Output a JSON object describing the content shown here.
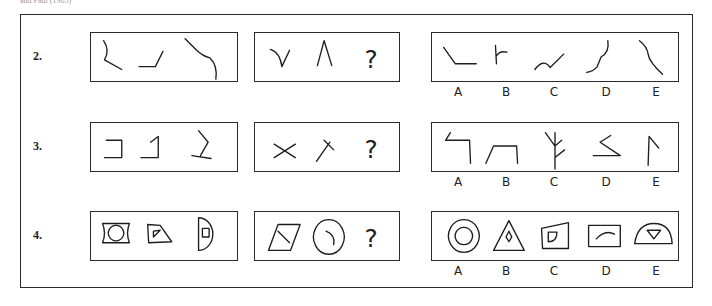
{
  "caption": "and Paul (1985)",
  "rows": [
    {
      "number": "2.",
      "top": 32,
      "example": [
        "M11 8 Q18 18 12 28 L30 38",
        "M48 35 L65 35 L73 19",
        "M96 6 L108 18 Q114 24 122 26 Q130 34 128 48"
      ],
      "question": [
        "M14 17 Q24 20 26 35 L34 18",
        "M63 34 L70 8 L78 34"
      ],
      "question_mark": "?",
      "options": [
        {
          "label": "A",
          "path": "M8 15 L20 32 L42 32"
        },
        {
          "label": "B",
          "path": "M62 13 L63 32 M63 24 Q66 18 74 20"
        },
        {
          "label": "C",
          "path": "M103 38 Q112 26 119 36 L133 22"
        },
        {
          "label": "D",
          "path": "M179 8 Q181 20 172 25 Q170 30 168 35 Q164 40 157 41"
        },
        {
          "label": "E",
          "path": "M212 8 Q220 14 221 22 Q222 30 236 43"
        }
      ]
    },
    {
      "number": "3.",
      "top": 122,
      "example": [
        "M14 18 L30 18 L30 36 L12 36",
        "M60 20 L68 14 L68 36 L50 36",
        "M110 8 L120 20 L112 34 M103 34 L123 37"
      ],
      "question": [
        "M18 22 L40 36 M18 36 L40 22",
        "M62 40 L76 20 M70 18 L80 28"
      ],
      "question_mark": "?",
      "options": [
        {
          "label": "A",
          "path": "M15 10 L10 18 L35 18 L36 42"
        },
        {
          "label": "B",
          "path": "M52 42 L60 24 L84 24 L85 42"
        },
        {
          "label": "C",
          "path": "M114 10 L124 24 L131 18 M124 10 L124 48 M124 36 L134 28"
        },
        {
          "label": "D",
          "path": "M171 20 L182 13 M171 20 L192 34 L164 34"
        },
        {
          "label": "E",
          "path": "M221 44 L222 14 L232 26"
        }
      ]
    },
    {
      "number": "4.",
      "top": 211,
      "example": [
        "M10 12 L38 12 Q34 22 38 32 L10 32 Q14 22 10 12 M24 14 A8 8 0 1 0 24.1 14",
        "M57 13 L70 14 L82 31 L58 32 Z M63 26 L70 19 L63 20 Z",
        "M110 6 A14 16 0 0 1 110 40 Z M114 17 L121 17 L121 26 L114 26 Z"
      ],
      "question": [
        "M12 40 L22 13 L45 13 L35 40 Z M22 20 L34 32",
        "M75 8 A16 18 0 1 1 74.9 8 M72 20 Q82 24 80 34"
      ],
      "question_mark": "?",
      "options": [
        {
          "label": "A",
          "path": "M29 8 A16 17 0 1 0 29.1 8 M29 16 A9 9 0 1 0 29.1 16"
        },
        {
          "label": "B",
          "path": "M76 9 L60 40 L92 40 Z M76 20 L79 26 L76 31 L73 26 Z"
        },
        {
          "label": "C",
          "path": "M110 17 L138 11 L138 38 L111 38 Z M117 21 L126 21 Q126 31 117 31 Z"
        },
        {
          "label": "D",
          "path": "M159 14 L192 14 L192 36 L159 36 Z M167 28 Q176 18 186 23"
        },
        {
          "label": "E",
          "path": "M207 33 Q210 12 227 12 Q245 12 246 33 Z M220 19 L234 19 L227 28 Z"
        }
      ]
    }
  ],
  "boxes": {
    "example": {
      "left": 90,
      "width": 148,
      "height": 50
    },
    "question": {
      "left": 254,
      "width": 146,
      "height": 50
    },
    "options": {
      "left": 431,
      "width": 248,
      "height": 50
    }
  },
  "option_label_x": [
    458,
    506,
    554,
    606,
    656
  ]
}
